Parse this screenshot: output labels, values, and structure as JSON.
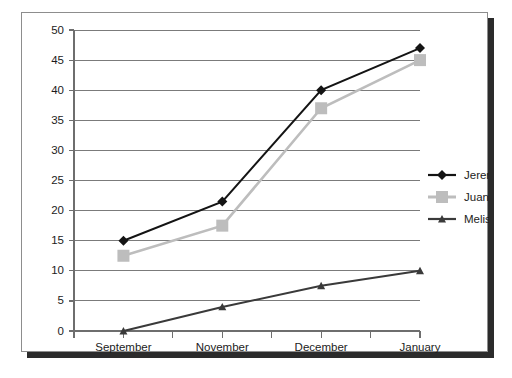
{
  "chart_data": {
    "type": "line",
    "title": "",
    "xlabel": "",
    "ylabel": "",
    "categories": [
      "September",
      "November",
      "December",
      "January"
    ],
    "x_tick_count": 8,
    "ylim": [
      0,
      50
    ],
    "y_ticks": [
      0,
      5,
      10,
      15,
      20,
      25,
      30,
      35,
      40,
      45,
      50
    ],
    "y_tick_labels": [
      "0",
      "5",
      "10",
      "15",
      "20",
      "25",
      "30",
      "35",
      "40",
      "45",
      "50"
    ],
    "grid": true,
    "legend_position": "right",
    "series": [
      {
        "name": "Jeremy",
        "values": [
          15,
          21.5,
          40,
          47
        ],
        "color": "#141414",
        "marker": "diamond"
      },
      {
        "name": "Juan",
        "values": [
          12.5,
          17.5,
          37,
          45
        ],
        "color": "#bdbdbd",
        "marker": "square"
      },
      {
        "name": "Melissa",
        "values": [
          0,
          4,
          7.5,
          10
        ],
        "color": "#3a3a3a",
        "marker": "triangle"
      }
    ]
  },
  "legend": {
    "entries": [
      {
        "label": "Jeremy"
      },
      {
        "label": "Juan"
      },
      {
        "label": "Melissa"
      }
    ]
  },
  "frame": {
    "border_color": "#8d8d8d",
    "shadow_color": "#2b2b2b",
    "background": "#ffffff"
  }
}
